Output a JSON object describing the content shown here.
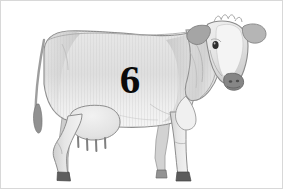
{
  "figure": {
    "medium": "pencil drawing",
    "orientation": "facing right, head turned toward viewer",
    "background_color": "#ffffff",
    "frame_color": "#d8d8d8",
    "width": 283,
    "height": 189
  },
  "brand": {
    "number": "6",
    "color": "#0a0a0a",
    "position": "mid-barrel, left-center of body"
  },
  "palette": {
    "body_light": "#eeeeee",
    "body_mid": "#dcdcdc",
    "body_shade": "#c6c6c6",
    "body_deep_shade": "#b0b0b0",
    "outline": "#8a8a8a",
    "outline_dark": "#6b6b6b",
    "muzzle": "#7d7d7d",
    "hoof": "#585858",
    "eye": "#2b2b2b",
    "ear_dark": "#9a9a9a",
    "tail_tuft": "#8e8e8e"
  },
  "anatomy": {
    "parts": [
      {
        "name": "head",
        "note": "turned toward viewer, white blaze down face"
      },
      {
        "name": "left-ear",
        "note": "darker grey, pointing left"
      },
      {
        "name": "right-ear",
        "note": "lighter grey, pointing right"
      },
      {
        "name": "poll-tuft",
        "note": "small hatched tuft between ears"
      },
      {
        "name": "eye",
        "note": "single dark eye visible on left of face"
      },
      {
        "name": "muzzle",
        "note": "dark grey with two nostrils"
      },
      {
        "name": "neck",
        "note": "shaded dewlap folds"
      },
      {
        "name": "barrel",
        "note": "large light grey body with vertical hatching"
      },
      {
        "name": "back-line",
        "note": "gently dipping spine from rump to withers"
      },
      {
        "name": "rump",
        "note": "rounded hip at left"
      },
      {
        "name": "tail",
        "note": "hangs down at far left with dark tuft"
      },
      {
        "name": "udder",
        "note": "rounded, four teats"
      },
      {
        "name": "front-legs",
        "note": "two legs, dark hooves"
      },
      {
        "name": "hind-legs",
        "note": "two legs with hocks, dark hooves"
      }
    ],
    "teat_count": 4,
    "leg_count": 4
  }
}
